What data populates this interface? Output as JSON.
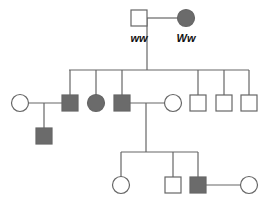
{
  "colors": {
    "affected": "#6b6b6b",
    "unaffected": "#ffffff",
    "line": "#666666"
  },
  "generation1": {
    "father": {
      "sex": "male",
      "affected": false,
      "genotype": "ww"
    },
    "mother": {
      "sex": "female",
      "affected": true,
      "genotype": "Ww"
    }
  },
  "generation2": [
    {
      "sex": "female",
      "affected": false,
      "role": "spouse"
    },
    {
      "sex": "male",
      "affected": true
    },
    {
      "sex": "female",
      "affected": true
    },
    {
      "sex": "male",
      "affected": true
    },
    {
      "sex": "female",
      "affected": false,
      "role": "spouse"
    },
    {
      "sex": "male",
      "affected": false
    },
    {
      "sex": "male",
      "affected": false
    },
    {
      "sex": "male",
      "affected": false
    }
  ],
  "generation3": [
    {
      "sex": "male",
      "affected": true,
      "parents": "II-1 x II-2"
    },
    {
      "sex": "female",
      "affected": false,
      "parents": "II-4 x II-5"
    },
    {
      "sex": "male",
      "affected": false,
      "parents": "II-4 x II-5"
    },
    {
      "sex": "male",
      "affected": true,
      "parents": "II-4 x II-5"
    },
    {
      "sex": "female",
      "affected": false,
      "role": "spouse"
    }
  ]
}
